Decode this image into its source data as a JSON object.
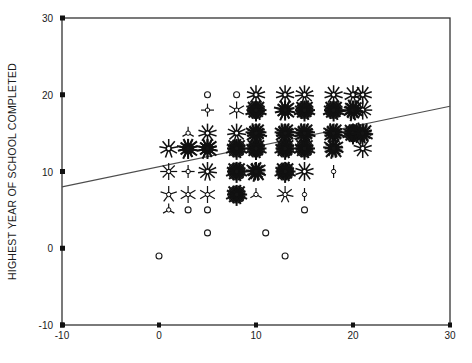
{
  "chart_data": {
    "type": "scatter",
    "title": "",
    "subtitle": "",
    "xlabel": "",
    "ylabel": "HIGHEST YEAR OF SCHOOL COMPLETED",
    "xlim": [
      -10,
      30
    ],
    "ylim": [
      -10,
      30
    ],
    "xticks": [
      -10,
      0,
      10,
      20,
      30
    ],
    "yticks": [
      -10,
      0,
      10,
      20,
      30
    ],
    "xtick_labels": [
      "-10",
      "0",
      "10",
      "20",
      "30"
    ],
    "ytick_labels": [
      "-10",
      "0",
      "10",
      "20",
      "30"
    ],
    "grid": false,
    "legend": null,
    "marker_style": "sunflower",
    "marker_note": "Sunflower plot: number of petals encodes the count of overlapping cases at each grid cell; open circle = 1 case.",
    "regression_line": {
      "name": "linear fit",
      "x": [
        -10,
        30
      ],
      "y": [
        8.0,
        18.5
      ],
      "slope": 0.2625,
      "intercept": 10.625,
      "color": "#4d4d4d"
    },
    "points": [
      {
        "x": 5,
        "y": 20,
        "count": 1
      },
      {
        "x": 8,
        "y": 20,
        "count": 1
      },
      {
        "x": 10,
        "y": 20,
        "count": 10
      },
      {
        "x": 13,
        "y": 20,
        "count": 10
      },
      {
        "x": 15,
        "y": 20,
        "count": 11
      },
      {
        "x": 18,
        "y": 20,
        "count": 10
      },
      {
        "x": 20,
        "y": 20,
        "count": 9
      },
      {
        "x": 21,
        "y": 20,
        "count": 10
      },
      {
        "x": 5,
        "y": 18,
        "count": 4
      },
      {
        "x": 8,
        "y": 18,
        "count": 6
      },
      {
        "x": 10,
        "y": 18,
        "count": 16
      },
      {
        "x": 13,
        "y": 18,
        "count": 14
      },
      {
        "x": 15,
        "y": 18,
        "count": 16
      },
      {
        "x": 18,
        "y": 18,
        "count": 16
      },
      {
        "x": 20,
        "y": 18,
        "count": 15
      },
      {
        "x": 21,
        "y": 18,
        "count": 12
      },
      {
        "x": 3,
        "y": 15,
        "count": 3
      },
      {
        "x": 5,
        "y": 15,
        "count": 10
      },
      {
        "x": 8,
        "y": 15,
        "count": 11
      },
      {
        "x": 10,
        "y": 15,
        "count": 17
      },
      {
        "x": 13,
        "y": 15,
        "count": 17
      },
      {
        "x": 15,
        "y": 15,
        "count": 17
      },
      {
        "x": 18,
        "y": 15,
        "count": 17
      },
      {
        "x": 20,
        "y": 15,
        "count": 16
      },
      {
        "x": 21,
        "y": 15,
        "count": 15
      },
      {
        "x": 1,
        "y": 13,
        "count": 9
      },
      {
        "x": 3,
        "y": 13,
        "count": 14
      },
      {
        "x": 5,
        "y": 13,
        "count": 14
      },
      {
        "x": 8,
        "y": 13,
        "count": 16
      },
      {
        "x": 10,
        "y": 13,
        "count": 16
      },
      {
        "x": 13,
        "y": 13,
        "count": 16
      },
      {
        "x": 15,
        "y": 13,
        "count": 16
      },
      {
        "x": 18,
        "y": 13,
        "count": 13
      },
      {
        "x": 21,
        "y": 13,
        "count": 10
      },
      {
        "x": 1,
        "y": 10,
        "count": 8
      },
      {
        "x": 3,
        "y": 10,
        "count": 4
      },
      {
        "x": 5,
        "y": 10,
        "count": 11
      },
      {
        "x": 8,
        "y": 10,
        "count": 16
      },
      {
        "x": 10,
        "y": 10,
        "count": 13
      },
      {
        "x": 13,
        "y": 10,
        "count": 16
      },
      {
        "x": 15,
        "y": 10,
        "count": 10
      },
      {
        "x": 18,
        "y": 10,
        "count": 2
      },
      {
        "x": 1,
        "y": 7,
        "count": 5
      },
      {
        "x": 3,
        "y": 7,
        "count": 6
      },
      {
        "x": 5,
        "y": 7,
        "count": 6
      },
      {
        "x": 8,
        "y": 7,
        "count": 16
      },
      {
        "x": 10,
        "y": 7,
        "count": 3
      },
      {
        "x": 13,
        "y": 7,
        "count": 7
      },
      {
        "x": 15,
        "y": 7,
        "count": 2
      },
      {
        "x": 1,
        "y": 5,
        "count": 3
      },
      {
        "x": 3,
        "y": 5,
        "count": 1
      },
      {
        "x": 5,
        "y": 5,
        "count": 1
      },
      {
        "x": 15,
        "y": 5,
        "count": 1
      },
      {
        "x": 5,
        "y": 2,
        "count": 1
      },
      {
        "x": 11,
        "y": 2,
        "count": 1
      },
      {
        "x": 0,
        "y": -1,
        "count": 1
      },
      {
        "x": 13,
        "y": -1,
        "count": 1
      }
    ]
  },
  "axes": {
    "frame_color": "#333333",
    "tick_color": "#111111",
    "y_axis_title": "HIGHEST YEAR OF SCHOOL COMPLETED"
  }
}
